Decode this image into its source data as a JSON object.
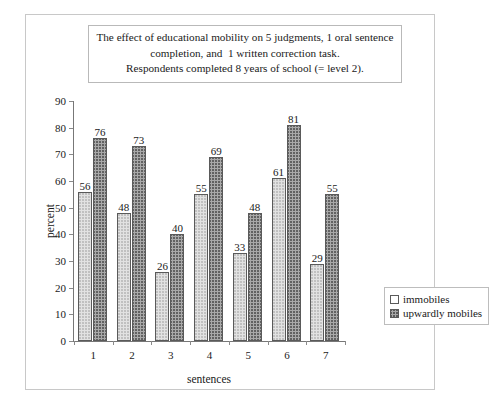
{
  "figure": {
    "title_lines": [
      "The effect of educational mobility on 5 judgments, 1 oral sentence",
      "completion, and  1 written correction task.",
      "Respondents completed 8 years of school (= level 2)."
    ]
  },
  "chart_data": {
    "type": "bar",
    "title": "The effect of educational mobility on 5 judgments, 1 oral sentence completion, and  1 written correction task. Respondents completed 8 years of school (= level 2).",
    "xlabel": "sentences",
    "ylabel": "percent",
    "categories": [
      "1",
      "2",
      "3",
      "4",
      "5",
      "6",
      "7"
    ],
    "yticks": [
      "0",
      "10",
      "20",
      "30",
      "40",
      "50",
      "60",
      "70",
      "80",
      "90"
    ],
    "ylim": [
      0,
      90
    ],
    "grid": false,
    "legend_position": "center-right",
    "series": [
      {
        "name": "immobiles",
        "values": [
          56,
          48,
          26,
          55,
          33,
          61,
          29
        ],
        "fill": "light-dotted",
        "color": "#e2e2e2"
      },
      {
        "name": "upwardly mobiles",
        "values": [
          76,
          73,
          40,
          69,
          48,
          81,
          55
        ],
        "fill": "dark-crosshatch",
        "color": "#a9a9a9"
      }
    ]
  }
}
